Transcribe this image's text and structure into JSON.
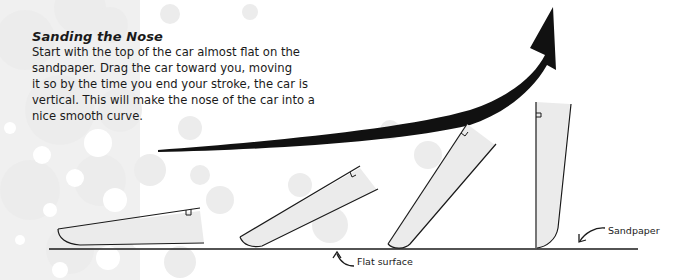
{
  "heading": "Sanding the Nose",
  "body_lines": [
    "Start with the top of the car almost flat on the",
    "sandpaper. Drag the car toward you, moving",
    "it so by the time you end your stroke, the car is",
    "vertical. This will make the nose of the car into a",
    "nice smooth curve."
  ],
  "labels": {
    "flat_surface": "Flat surface",
    "sandpaper": "Sandpaper"
  },
  "diagram": {
    "car_positions": [
      "almost-flat",
      "slight-tilt",
      "steep-tilt",
      "vertical"
    ],
    "arrow_direction": "up-right",
    "colors": {
      "ink": "#1a1a1a",
      "car_fill": "#ebebeb",
      "dots": "#e6e6e6",
      "background": "#ffffff"
    }
  }
}
